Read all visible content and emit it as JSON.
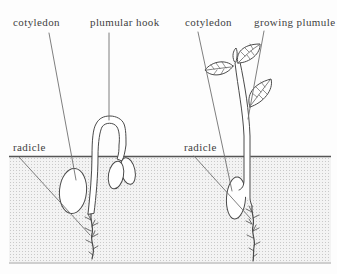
{
  "diagram": {
    "left_seedling": {
      "cotyledon_label": "cotyledon",
      "plumular_hook_label": "plumular hook",
      "radicle_label": "radicle"
    },
    "right_seedling": {
      "cotyledon_label": "cotyledon",
      "growing_plumule_label": "growing plumule",
      "radicle_label": "radicle"
    },
    "colors": {
      "line": "#4a4a4a",
      "leader_line": "#707070",
      "ground_line": "#555555",
      "text": "#3f3f3f",
      "soil_dot": "#c9c9c9",
      "soil_base": "#f3f3f3",
      "paper": "#fdfdfd"
    }
  }
}
